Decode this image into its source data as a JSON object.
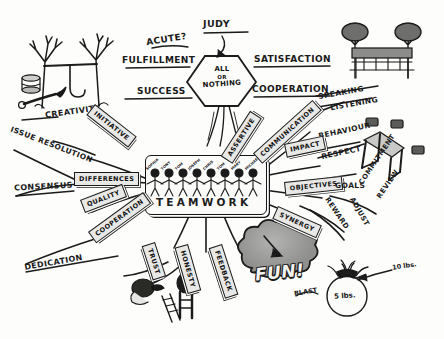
{
  "center": {
    "word": "TEAMWORK",
    "people": [
      "SOPHIA",
      "TONY",
      "TOM",
      "JOSEPH",
      "CHRIS",
      "TOM",
      "MARY",
      "MICHAEL"
    ]
  },
  "hexagon": {
    "line1": "ALL",
    "line2": "OR",
    "line3": "NOTHING"
  },
  "top_branches": [
    {
      "label": "ACUTE?"
    },
    {
      "label": "JUDY"
    },
    {
      "label": "FULFILLMENT"
    },
    {
      "label": "SATISFACTION"
    },
    {
      "label": "SUCCESS"
    },
    {
      "label": "COOPERATION"
    }
  ],
  "left_branches": [
    {
      "label": "CREATIVITY",
      "boxed": false
    },
    {
      "label": "INITIATIVE",
      "boxed": true
    },
    {
      "label": "ISSUE RESOLUTION",
      "boxed": false
    },
    {
      "label": "DIFFERENCES",
      "boxed": true
    },
    {
      "label": "CONSENSUS",
      "boxed": false
    },
    {
      "label": "QUALITY",
      "boxed": true
    },
    {
      "label": "COOPERATION",
      "boxed": true
    },
    {
      "label": "DEDICATION",
      "boxed": false
    }
  ],
  "right_branches": [
    {
      "label": "ASSERTIVE",
      "boxed": true
    },
    {
      "label": "COMMUNICATION",
      "boxed": true
    },
    {
      "label": "SPEAKING",
      "boxed": false
    },
    {
      "label": "LISTENING",
      "boxed": false
    },
    {
      "label": "BEHAVIOUR",
      "boxed": false
    },
    {
      "label": "RESPECT",
      "boxed": false
    },
    {
      "label": "IMPACT",
      "boxed": true
    },
    {
      "label": "OBJECTIVES",
      "boxed": true
    },
    {
      "label": "GOALS",
      "boxed": false
    },
    {
      "label": "COMMITMENT",
      "boxed": false
    },
    {
      "label": "REVIEW",
      "boxed": false
    },
    {
      "label": "REWARD",
      "boxed": false
    },
    {
      "label": "ADJUST",
      "boxed": false
    },
    {
      "label": "SYNERGY",
      "boxed": true
    }
  ],
  "bottom_branches": [
    {
      "label": "TRUST",
      "boxed": true
    },
    {
      "label": "HONESTY",
      "boxed": true
    },
    {
      "label": "FEEDBACK",
      "boxed": true
    }
  ],
  "fun_cloud": {
    "label": "FUN!"
  },
  "weights": {
    "top_label": "10 lbs.",
    "ball_label": "5 lbs.",
    "blast_label": "BLAST"
  },
  "colors": {
    "ink": "#1a1a1a",
    "paper": "#fdfdfc",
    "box_fill": "#e8e8e6",
    "cloud_fill": "#9d9d9b"
  }
}
